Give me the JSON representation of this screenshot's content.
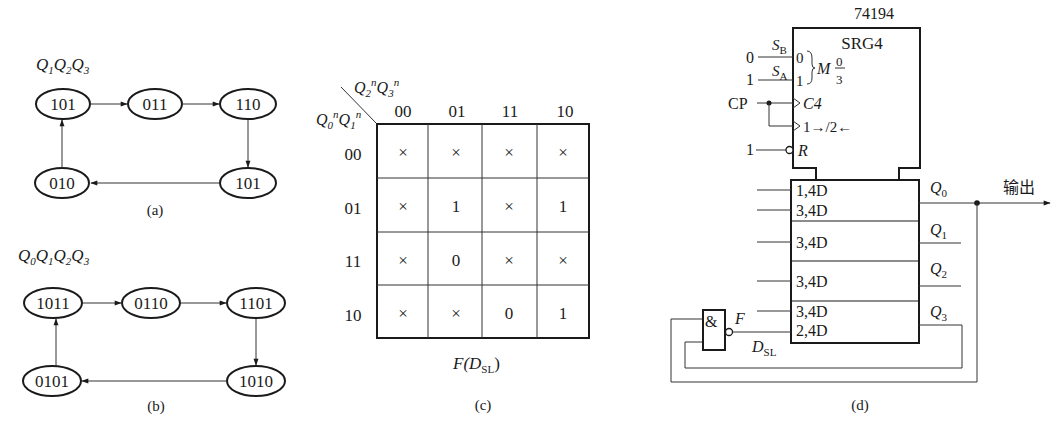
{
  "figure_a": {
    "header_var": "Q",
    "header_subs": [
      "1",
      "2",
      "3"
    ],
    "states": [
      "101",
      "011",
      "110",
      "101",
      "010"
    ],
    "caption": "(a)"
  },
  "figure_b": {
    "header_var": "Q",
    "header_subs": [
      "0",
      "1",
      "2",
      "3"
    ],
    "states": [
      "1011",
      "0110",
      "1101",
      "1010",
      "0101"
    ],
    "caption": "(b)"
  },
  "figure_c": {
    "col_var_label": "Q2nQ3n",
    "row_var_label": "Q0nQ1n",
    "col_headers": [
      "00",
      "01",
      "11",
      "10"
    ],
    "row_headers": [
      "00",
      "01",
      "11",
      "10"
    ],
    "cells": [
      [
        "×",
        "×",
        "×",
        "×"
      ],
      [
        "×",
        "1",
        "×",
        "1"
      ],
      [
        "×",
        "0",
        "×",
        "×"
      ],
      [
        "×",
        "×",
        "0",
        "1"
      ]
    ],
    "function_label": "F(D",
    "function_sub": "SL",
    "function_close": ")",
    "caption": "(c)"
  },
  "figure_d": {
    "chip_name": "74194",
    "block_name": "SRG4",
    "sb_label": "S",
    "sb_sub": "B",
    "sa_label": "S",
    "sa_sub": "A",
    "sb_value": "0",
    "sa_value": "1",
    "mode_in0": "0",
    "mode_in1": "1",
    "mode_label": "M",
    "mode_frac_top": "0",
    "mode_frac_bot": "3",
    "clock_in": "CP",
    "clock_label": "C4",
    "shift_label": "1→/2←",
    "reset_value": "1",
    "reset_label": "R",
    "inputs": [
      "1,4D",
      "3,4D",
      "3,4D",
      "3,4D",
      "3,4D",
      "2,4D"
    ],
    "outputs": [
      "Q0",
      "Q1",
      "Q2",
      "Q3"
    ],
    "output_var": "Q",
    "output_subs": [
      "0",
      "1",
      "2",
      "3"
    ],
    "output_label": "输出",
    "gate_label": "&",
    "gate_out_label": "F",
    "dsl_label": "D",
    "dsl_sub": "SL",
    "caption": "(d)"
  }
}
